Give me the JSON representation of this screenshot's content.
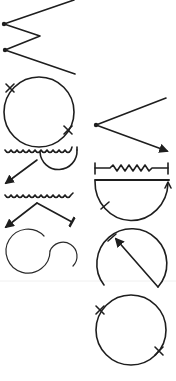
{
  "figure": {
    "background": "#ffffff",
    "ink_color": "#1e1e1e",
    "shapes": [
      {
        "id": "zigzag",
        "label": "zigzag line with two endpoint dots"
      },
      {
        "id": "circle-two-ticks-a",
        "label": "circle with two cross tick marks"
      },
      {
        "id": "wavy-semicircle-arrow",
        "label": "wavy line with semicircle and arrow"
      },
      {
        "id": "wavy-angle-arrow",
        "label": "wavy line with angled arrow pair"
      },
      {
        "id": "s-curve",
        "label": "S-shaped double arc"
      },
      {
        "id": "v-arrow",
        "label": "V shape with dot and arrow"
      },
      {
        "id": "resistor-bar",
        "label": "zigzag resistor between two bars"
      },
      {
        "id": "semicircle-ticked",
        "label": "semicircle with tick and arrow"
      },
      {
        "id": "circle-diagonal-arrow",
        "label": "open circle with diagonal arrow"
      },
      {
        "id": "circle-two-ticks-b",
        "label": "circle with two cross tick marks"
      }
    ]
  }
}
